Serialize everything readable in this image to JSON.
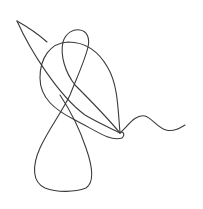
{
  "drawing": {
    "background": "#ffffff",
    "stroke_color": "#3a3a3a",
    "stroke_width": 1.1,
    "paths": [
      {
        "name": "left-tip-short-stroke",
        "d": "M47,42 C38,34 26,26 17,21"
      },
      {
        "name": "long-diagonal",
        "d": "M17,21 C30,50 58,95 85,115 C100,124 113,129 120,133"
      },
      {
        "name": "big-teardrop",
        "d": "M120,133 C118,110 118,85 108,68 C98,50 85,42 68,42 C50,43 40,58 40,78 C40,98 55,110 75,120 C95,130 110,142 122,138 C126,134 122,130 120,133"
      },
      {
        "name": "top-small-loop-and-crossing",
        "d": "M120,133 C105,115 90,100 75,85 C65,72 60,55 63,42 C66,32 74,29 80,30 C87,31 90,38 88,47 C85,60 78,75 70,95 C62,112 48,130 40,148 C32,166 32,182 45,188 C58,193 75,192 86,188 C95,182 92,165 86,148 C80,130 70,110 60,95"
      },
      {
        "name": "wavy-tail",
        "d": "M120,133 C128,126 135,114 145,116 C152,118 158,128 166,130 C174,132 180,128 185,125"
      }
    ]
  }
}
